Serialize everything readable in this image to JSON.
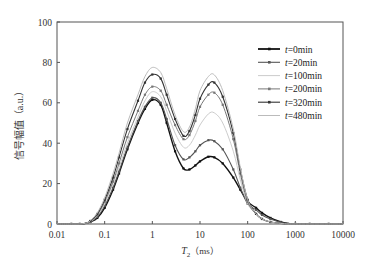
{
  "chart_data": {
    "type": "line",
    "title": "",
    "xlabel": "T2 (ms)",
    "xlabel_main": "T",
    "xlabel_sub": "2",
    "xlabel_unit": "（ms）",
    "ylabel": "信号幅值（a.u.）",
    "xscale": "log",
    "xlim": [
      0.01,
      10000
    ],
    "ylim": [
      0,
      100
    ],
    "grid": false,
    "legend_position": "upper right",
    "x_ticks": [
      0.01,
      0.1,
      1,
      10,
      100,
      1000,
      10000
    ],
    "x_tick_labels": [
      "0.01",
      "0.1",
      "1",
      "10",
      "100",
      "1000",
      "10000"
    ],
    "y_ticks": [
      0,
      20,
      40,
      60,
      80,
      100
    ],
    "y_tick_labels": [
      "0",
      "20",
      "40",
      "60",
      "80",
      "100"
    ],
    "x": [
      0.01,
      0.02,
      0.03,
      0.04,
      0.05,
      0.07,
      0.1,
      0.15,
      0.2,
      0.3,
      0.5,
      0.7,
      1,
      1.5,
      2,
      3,
      4.5,
      6,
      8,
      10,
      15,
      20,
      30,
      50,
      70,
      100,
      150,
      200,
      300,
      500,
      700,
      1000,
      2000,
      5000,
      10000
    ],
    "series": [
      {
        "name": "t=0min",
        "color": "#111111",
        "width": 1.4,
        "marker": true,
        "values": [
          0,
          0,
          0,
          0.3,
          1,
          3,
          8,
          17,
          25,
          37,
          50,
          57,
          61.5,
          59,
          50,
          36,
          27.5,
          27,
          29,
          31,
          33.3,
          33,
          30,
          23,
          17,
          11,
          8,
          5.5,
          3,
          1,
          0.3,
          0,
          0,
          0,
          0
        ]
      },
      {
        "name": "t=20min",
        "color": "#555555",
        "width": 1.1,
        "marker": true,
        "values": [
          0,
          0,
          0,
          0.3,
          1,
          3.5,
          9,
          18,
          26,
          38,
          51,
          58,
          62.5,
          60,
          52,
          39,
          32,
          33,
          36,
          39,
          41.5,
          41,
          37,
          27,
          18,
          10,
          7,
          4.5,
          2.5,
          0.8,
          0.2,
          0,
          0,
          0,
          0
        ]
      },
      {
        "name": "t=100min",
        "color": "#cccccc",
        "width": 1.0,
        "marker": false,
        "values": [
          0,
          0,
          0,
          0.3,
          1.2,
          4,
          10,
          20,
          28,
          40,
          53,
          61,
          65.5,
          63,
          56,
          45,
          38,
          39,
          44,
          49,
          54.5,
          55,
          50,
          36,
          22,
          10,
          5,
          2.5,
          1,
          0.3,
          0,
          0,
          0,
          0,
          0
        ]
      },
      {
        "name": "t=200min",
        "color": "#777777",
        "width": 1.0,
        "marker": true,
        "values": [
          0,
          0,
          0,
          0.3,
          1.3,
          4.5,
          11,
          21,
          30,
          43,
          56,
          64,
          68,
          66,
          59,
          49,
          42,
          44,
          51,
          58,
          64,
          65,
          59,
          42,
          25,
          11,
          5,
          2.5,
          1,
          0.3,
          0,
          0,
          0,
          0,
          0
        ]
      },
      {
        "name": "t=320min",
        "color": "#333333",
        "width": 1.1,
        "marker": true,
        "values": [
          0,
          0,
          0,
          0.4,
          1.5,
          5,
          12,
          23,
          33,
          47,
          61,
          70,
          74,
          72,
          64,
          52,
          43.6,
          46,
          54,
          62,
          69,
          70,
          63,
          45,
          27,
          12,
          5,
          2.5,
          1,
          0.3,
          0,
          0,
          0,
          0,
          0
        ]
      },
      {
        "name": "t=480min",
        "color": "#bbbbbb",
        "width": 1.0,
        "marker": false,
        "values": [
          0,
          0,
          0,
          0.4,
          1.6,
          5.5,
          13,
          25,
          35,
          50,
          64,
          73,
          77.5,
          75,
          67,
          54,
          45.7,
          48,
          57,
          66,
          73,
          73.8,
          66,
          47,
          28,
          12,
          5,
          2.5,
          1,
          0.3,
          0,
          0,
          0,
          0,
          0
        ]
      }
    ]
  },
  "legend": {
    "items": [
      {
        "prefix": "t",
        "label": "=0min"
      },
      {
        "prefix": "t",
        "label": "=20min"
      },
      {
        "prefix": "t",
        "label": "=100min"
      },
      {
        "prefix": "t",
        "label": "=200min"
      },
      {
        "prefix": "t",
        "label": "=320min"
      },
      {
        "prefix": "t",
        "label": "=480min"
      }
    ]
  }
}
